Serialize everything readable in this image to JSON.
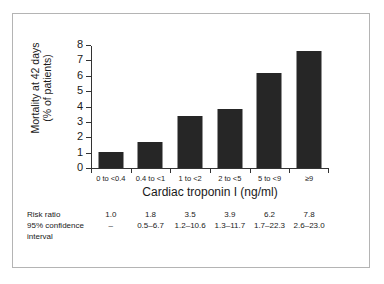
{
  "chart_data": {
    "type": "bar",
    "title": "",
    "subtitle": "",
    "xlabel": "Cardiac troponin I (ng/ml)",
    "ylabel": "Mortality at 42 days (% of patients)",
    "ylabel_line1": "Mortality at 42 days",
    "ylabel_line2": "(% of patients)",
    "categories": [
      "0 to <0.4",
      "0.4 to <1",
      "1 to <2",
      "2 to <5",
      "5 to <9",
      "≥9"
    ],
    "values": [
      1.05,
      1.7,
      3.4,
      3.85,
      6.15,
      7.6
    ],
    "series": [
      {
        "name": "Mortality at 42 days (% of patients)",
        "values": [
          1.05,
          1.7,
          3.4,
          3.85,
          6.15,
          7.6
        ]
      }
    ],
    "ylim": [
      0,
      8
    ],
    "ytick_labels": [
      "0",
      "1",
      "2",
      "3",
      "4",
      "5",
      "6",
      "7",
      "8"
    ],
    "ytick_values": [
      0,
      1,
      2,
      3,
      4,
      5,
      6,
      7,
      8
    ],
    "grid": false,
    "legend": false,
    "legend_position": "none",
    "bar_color": "#262626",
    "axis_color": "#333333"
  },
  "stats": {
    "rows": [
      {
        "label": "Risk ratio",
        "label_line2": "",
        "values": [
          "1.0",
          "1.8",
          "3.5",
          "3.9",
          "6.2",
          "7.8"
        ]
      },
      {
        "label": "95% confidence",
        "label_line2": "interval",
        "values": [
          "–",
          "0.5–6.7",
          "1.2–10.6",
          "1.3–11.7",
          "1.7–22.3",
          "2.6–23.0"
        ]
      }
    ]
  },
  "frame": {
    "border_color": "#b4b4b4",
    "background": "#ffffff"
  }
}
